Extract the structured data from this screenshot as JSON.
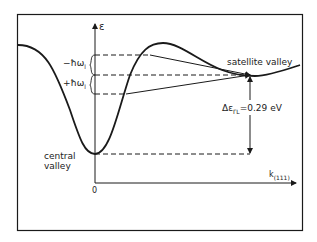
{
  "diagram": {
    "axis_y_label": "ε",
    "axis_x_label": "k",
    "axis_x_subscript": "(111)",
    "origin_label": "0",
    "minus_phonon_label": "−ħω",
    "minus_phonon_sub": "l",
    "plus_phonon_label": "+ħω",
    "plus_phonon_sub": "l",
    "satellite_label": "satellite valley",
    "central_label_line1": "central",
    "central_label_line2": "valley",
    "energy_gap_prefix": "Δε",
    "energy_gap_sub": "ΓL",
    "energy_gap_value": "=0.29 eV",
    "colors": {
      "line": "#1a1a1a",
      "background": "#ffffff"
    }
  }
}
